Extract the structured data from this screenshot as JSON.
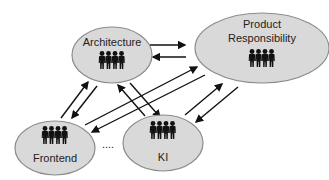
{
  "diagram": {
    "colors": {
      "node_fill": "#d9d9d9",
      "node_stroke": "#8c8c8c",
      "arrow": "#111111",
      "people_icon": "#111111",
      "text": "#222222"
    },
    "nodes": [
      {
        "id": "architecture",
        "label_lines": [
          "Architecture"
        ],
        "icon": "group-of-people-icon",
        "cx": 112,
        "cy": 55,
        "rx": 40,
        "ry": 28
      },
      {
        "id": "product-responsibility",
        "label_lines": [
          "Product",
          "Responsibility"
        ],
        "icon": "group-of-people-icon",
        "cx": 262,
        "cy": 48,
        "rx": 67,
        "ry": 35
      },
      {
        "id": "frontend",
        "label_lines": [
          "Frontend"
        ],
        "icon": "group-of-people-icon",
        "cx": 55,
        "cy": 148,
        "rx": 40,
        "ry": 27
      },
      {
        "id": "ki",
        "label_lines": [
          "KI"
        ],
        "icon": "group-of-people-icon",
        "cx": 163,
        "cy": 143,
        "rx": 40,
        "ry": 28
      }
    ],
    "ellipsis": {
      "text": "....",
      "x": 108,
      "y": 148
    },
    "edges": [
      {
        "from": "architecture",
        "to": "product-responsibility"
      },
      {
        "from": "product-responsibility",
        "to": "architecture"
      },
      {
        "from": "frontend",
        "to": "architecture"
      },
      {
        "from": "architecture",
        "to": "frontend"
      },
      {
        "from": "frontend",
        "to": "product-responsibility"
      },
      {
        "from": "product-responsibility",
        "to": "frontend"
      },
      {
        "from": "ki",
        "to": "architecture"
      },
      {
        "from": "architecture",
        "to": "ki"
      },
      {
        "from": "ki",
        "to": "product-responsibility"
      },
      {
        "from": "product-responsibility",
        "to": "ki"
      }
    ]
  },
  "labels": {
    "architecture": "Architecture",
    "product_line1": "Product",
    "product_line2": "Responsibility",
    "frontend": "Frontend",
    "ki": "KI",
    "ellipsis": "...."
  }
}
